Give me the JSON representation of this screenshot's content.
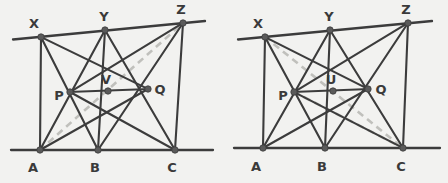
{
  "image": {
    "width": 448,
    "height": 183,
    "background_color": "#f2f2f0",
    "description": "Two geometric point-line configurations side by side"
  },
  "style": {
    "solid_line_color": "#3c3c3c",
    "dashed_line_color": "#c0c0bc",
    "node_fill_color": "#5a5a5a",
    "node_stroke_color": "#3c3c3c",
    "label_color": "#3a3a3a",
    "solid_line_width": 2.1,
    "baseline_width": 2.3,
    "dashed_line_width": 2.6,
    "dash_pattern": "7 5",
    "node_radius": 3.2,
    "label_font_size": 13
  },
  "figures": [
    {
      "name": "left-figure",
      "points": [
        {
          "id": "X",
          "label": "X",
          "x": 41,
          "y": 37,
          "label_x": 34,
          "label_y": 23
        },
        {
          "id": "Y",
          "label": "Y",
          "x": 105,
          "y": 30,
          "label_x": 104,
          "label_y": 16
        },
        {
          "id": "Z",
          "label": "Z",
          "x": 183,
          "y": 23,
          "label_x": 181,
          "label_y": 9
        },
        {
          "id": "P",
          "label": "P",
          "x": 70,
          "y": 92,
          "label_x": 59,
          "label_y": 95
        },
        {
          "id": "V",
          "label": "V",
          "x": 108,
          "y": 91,
          "label_x": 106,
          "label_y": 79
        },
        {
          "id": "Q",
          "label": "Q",
          "x": 148,
          "y": 89,
          "label_x": 160,
          "label_y": 89
        },
        {
          "id": "A",
          "label": "A",
          "x": 40,
          "y": 150,
          "label_x": 33,
          "label_y": 167
        },
        {
          "id": "B",
          "label": "B",
          "x": 98,
          "y": 150,
          "label_x": 95,
          "label_y": 167
        },
        {
          "id": "C",
          "label": "C",
          "x": 175,
          "y": 150,
          "label_x": 172,
          "label_y": 167
        }
      ],
      "baselines": [
        {
          "name": "upper-baseline",
          "x1": 13,
          "y1": 39.5,
          "x2": 205,
          "y2": 21.0
        },
        {
          "name": "lower-baseline",
          "x1": 11,
          "y1": 150,
          "x2": 213,
          "y2": 150
        }
      ],
      "segments": [
        {
          "name": "segment-X-B",
          "from": "X",
          "to": "B"
        },
        {
          "name": "segment-X-Q",
          "from": "X",
          "to": "Q"
        },
        {
          "name": "segment-X-A",
          "from": "X",
          "to": "A"
        },
        {
          "name": "segment-Y-A",
          "from": "Y",
          "to": "A"
        },
        {
          "name": "segment-Y-B",
          "from": "Y",
          "to": "B"
        },
        {
          "name": "segment-Y-C",
          "from": "Y",
          "to": "C"
        },
        {
          "name": "segment-Z-P",
          "from": "Z",
          "to": "P"
        },
        {
          "name": "segment-Z-B",
          "from": "Z",
          "to": "B"
        },
        {
          "name": "segment-Z-C",
          "from": "Z",
          "to": "C"
        },
        {
          "name": "segment-P-Q",
          "from": "P",
          "to": "Q"
        },
        {
          "name": "segment-P-C",
          "from": "P",
          "to": "C"
        },
        {
          "name": "segment-A-Q",
          "from": "A",
          "to": "Q"
        }
      ],
      "dashed_lines": [
        {
          "name": "dashed-line-A-Z",
          "from": "A",
          "to": "Z",
          "through": "V"
        }
      ],
      "center_point": "V"
    },
    {
      "name": "right-figure",
      "points": [
        {
          "id": "X",
          "label": "X",
          "x": 265,
          "y": 37,
          "label_x": 258,
          "label_y": 23
        },
        {
          "id": "Y",
          "label": "Y",
          "x": 330,
          "y": 30,
          "label_x": 329,
          "label_y": 16
        },
        {
          "id": "Z",
          "label": "Z",
          "x": 408,
          "y": 23,
          "label_x": 406,
          "label_y": 9
        },
        {
          "id": "P",
          "label": "P",
          "x": 294,
          "y": 92,
          "label_x": 283,
          "label_y": 95
        },
        {
          "id": "U",
          "label": "U",
          "x": 333,
          "y": 91,
          "label_x": 331,
          "label_y": 79
        },
        {
          "id": "Q",
          "label": "Q",
          "x": 368,
          "y": 89,
          "label_x": 381,
          "label_y": 89
        },
        {
          "id": "A",
          "label": "A",
          "x": 263,
          "y": 148,
          "label_x": 256,
          "label_y": 166
        },
        {
          "id": "B",
          "label": "B",
          "x": 325,
          "y": 148,
          "label_x": 322,
          "label_y": 166
        },
        {
          "id": "C",
          "label": "C",
          "x": 403,
          "y": 148,
          "label_x": 401,
          "label_y": 166
        }
      ],
      "baselines": [
        {
          "name": "upper-baseline",
          "x1": 238,
          "y1": 39.5,
          "x2": 432,
          "y2": 21.0
        },
        {
          "name": "lower-baseline",
          "x1": 234,
          "y1": 148,
          "x2": 440,
          "y2": 148
        }
      ],
      "segments": [
        {
          "name": "segment-X-B",
          "from": "X",
          "to": "B"
        },
        {
          "name": "segment-X-Q",
          "from": "X",
          "to": "Q"
        },
        {
          "name": "segment-X-A",
          "from": "X",
          "to": "A"
        },
        {
          "name": "segment-Y-A",
          "from": "Y",
          "to": "A"
        },
        {
          "name": "segment-Y-B",
          "from": "Y",
          "to": "B"
        },
        {
          "name": "segment-Y-C",
          "from": "Y",
          "to": "C"
        },
        {
          "name": "segment-Z-P",
          "from": "Z",
          "to": "P"
        },
        {
          "name": "segment-Z-B",
          "from": "Z",
          "to": "B"
        },
        {
          "name": "segment-Z-C",
          "from": "Z",
          "to": "C"
        },
        {
          "name": "segment-P-Q",
          "from": "P",
          "to": "Q"
        },
        {
          "name": "segment-P-C",
          "from": "P",
          "to": "C"
        },
        {
          "name": "segment-A-Q",
          "from": "A",
          "to": "Q"
        }
      ],
      "dashed_lines": [
        {
          "name": "dashed-line-X-C",
          "from": "X",
          "to": "C",
          "through": "U"
        },
        {
          "name": "dashed-line-P-C",
          "from": "P",
          "to": "C",
          "through": null
        }
      ],
      "center_point": "U"
    }
  ]
}
